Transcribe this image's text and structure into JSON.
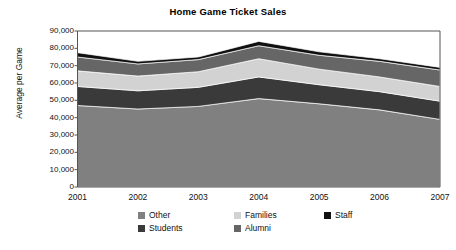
{
  "chart_data": {
    "type": "area",
    "stacked": true,
    "title": "Home Game Ticket Sales",
    "xlabel": "",
    "ylabel": "Average per Game",
    "x": [
      2001,
      2002,
      2003,
      2004,
      2005,
      2006,
      2007
    ],
    "categories": [
      "2001",
      "2002",
      "2003",
      "2004",
      "2005",
      "2006",
      "2007"
    ],
    "ylim": [
      0,
      90000
    ],
    "yticks": [
      0,
      10000,
      20000,
      30000,
      40000,
      50000,
      60000,
      70000,
      80000,
      90000
    ],
    "ytick_labels": [
      "0",
      "10,000",
      "20,000",
      "30,000",
      "40,000",
      "50,000",
      "60,000",
      "70,000",
      "80,000",
      "90,000"
    ],
    "grid": false,
    "legend_position": "bottom",
    "series": [
      {
        "name": "Other",
        "color": "#808080",
        "values": [
          47000,
          45000,
          46500,
          51000,
          48000,
          44500,
          39000
        ]
      },
      {
        "name": "Students",
        "color": "#3a3a3a",
        "values": [
          11000,
          10500,
          11000,
          12500,
          11000,
          10500,
          10500
        ]
      },
      {
        "name": "Families",
        "color": "#d2d2d2",
        "values": [
          9000,
          8500,
          9000,
          10500,
          9000,
          8500,
          8500
        ]
      },
      {
        "name": "Alumni",
        "color": "#666666",
        "values": [
          8000,
          7000,
          7000,
          7500,
          8000,
          9000,
          9500
        ]
      },
      {
        "name": "Staff",
        "color": "#101010",
        "values": [
          2500,
          1500,
          1500,
          2500,
          2000,
          1500,
          1500
        ]
      }
    ],
    "cumulative_tops": {
      "Other": [
        47000,
        45000,
        46500,
        51000,
        48000,
        44500,
        39000
      ],
      "Students": [
        58000,
        55500,
        57500,
        63500,
        59000,
        55000,
        49500
      ],
      "Families": [
        67000,
        64000,
        66500,
        74000,
        68000,
        63500,
        58000
      ],
      "Alumni": [
        75000,
        71000,
        73500,
        81500,
        76000,
        72500,
        67500
      ],
      "Staff": [
        77500,
        72500,
        75000,
        84000,
        78000,
        74000,
        69000
      ]
    },
    "plot_background": "#ffffff",
    "axis_color": "#555555"
  },
  "legend": {
    "items": [
      {
        "label": "Other",
        "color": "#808080"
      },
      {
        "label": "Families",
        "color": "#d2d2d2"
      },
      {
        "label": "Staff",
        "color": "#101010"
      },
      {
        "label": "Students",
        "color": "#3a3a3a"
      },
      {
        "label": "Alumni",
        "color": "#666666"
      }
    ]
  }
}
